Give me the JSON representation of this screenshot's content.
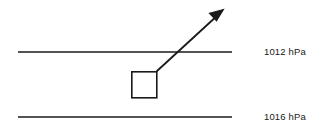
{
  "diagram": {
    "type": "meteorological-isobar-diagram",
    "background_color": "#ffffff",
    "stroke_color": "#1a1a1a",
    "isobars": [
      {
        "id": "isobar-top",
        "label": "1012 hPa",
        "pressure_value": 1012,
        "unit": "hPa",
        "y": 52,
        "x_start": 18,
        "x_end": 232,
        "label_x": 264,
        "label_y": 47
      },
      {
        "id": "isobar-bottom",
        "label": "1016 hPa",
        "pressure_value": 1016,
        "unit": "hPa",
        "y": 117,
        "x_start": 18,
        "x_end": 232,
        "label_x": 264,
        "label_y": 112
      }
    ],
    "air_parcel": {
      "id": "air-parcel-box",
      "shape": "square",
      "x": 131,
      "y": 71,
      "width": 26,
      "height": 27,
      "fill": "none",
      "stroke": "#1a1a1a",
      "stroke_width": 1.6
    },
    "motion_arrow": {
      "id": "motion-arrow",
      "x1": 157,
      "y1": 71,
      "x2": 219,
      "y2": 14,
      "tip_x": 223,
      "tip_y": 10,
      "stroke": "#1a1a1a",
      "stroke_width": 1.8,
      "head_length": 14,
      "head_width": 9
    }
  }
}
